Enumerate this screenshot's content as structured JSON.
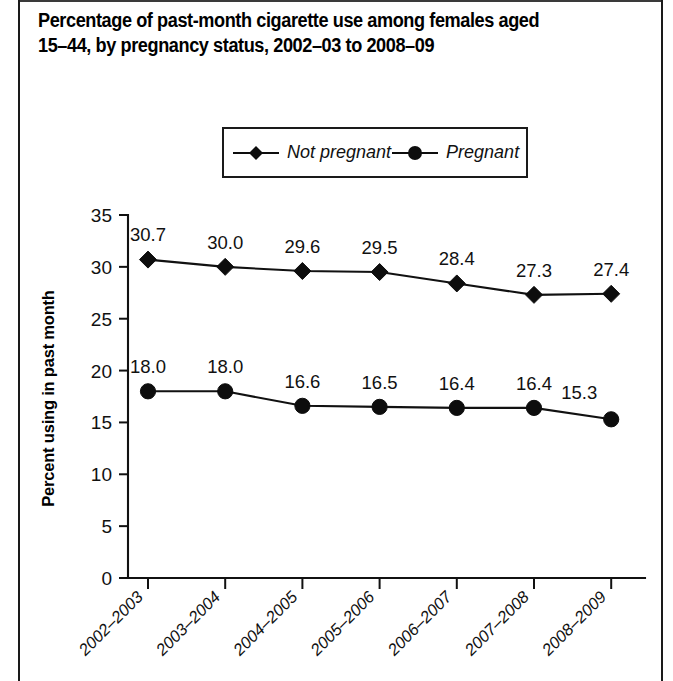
{
  "title": "Percentage of past-month cigarette use among females aged\n15–44, by pregnancy status, 2002–03 to 2008–09",
  "legend": {
    "items": [
      {
        "label": "Not pregnant",
        "marker": "diamond-marker",
        "color": "#0d0d0d"
      },
      {
        "label": "Pregnant",
        "marker": "circle-marker",
        "color": "#0d0d0d"
      }
    ]
  },
  "chart_data": {
    "type": "line",
    "title": "Percentage of past-month cigarette use among females aged 15–44, by pregnancy status, 2002–03 to 2008–09",
    "xlabel": "",
    "ylabel": "Percent using in past month",
    "categories": [
      "2002–2003",
      "2003–2004",
      "2004–2005",
      "2005–2006",
      "2006–2007",
      "2007–2008",
      "2008–2009"
    ],
    "series": [
      {
        "name": "Not pregnant",
        "marker": "diamond",
        "color": "#0d0d0d",
        "values": [
          30.7,
          30.0,
          29.6,
          29.5,
          28.4,
          27.3,
          27.4
        ],
        "labels": [
          "30.7",
          "30.0",
          "29.6",
          "29.5",
          "28.4",
          "27.3",
          "27.4"
        ]
      },
      {
        "name": "Pregnant",
        "marker": "circle",
        "color": "#0d0d0d",
        "values": [
          18.0,
          18.0,
          16.6,
          16.5,
          16.4,
          16.4,
          15.3
        ],
        "labels": [
          "18.0",
          "18.0",
          "16.6",
          "16.5",
          "16.4",
          "16.4",
          "15.3"
        ]
      }
    ],
    "ylim": [
      0,
      35
    ],
    "yticks": [
      0,
      5,
      10,
      15,
      20,
      25,
      30,
      35
    ],
    "ytick_labels": [
      "0",
      "5",
      "10",
      "15",
      "20",
      "25",
      "30",
      "35"
    ],
    "grid": false,
    "legend_position": "top-center",
    "xtick_rotation": -45
  }
}
